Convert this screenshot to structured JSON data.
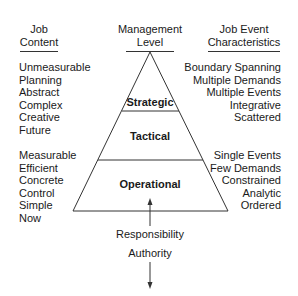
{
  "headers": {
    "left": [
      "Job",
      "Content"
    ],
    "center": [
      "Management",
      "Level"
    ],
    "right": [
      "Job Event",
      "Characteristics"
    ]
  },
  "levels": [
    "Strategic",
    "Tactical",
    "Operational"
  ],
  "left_upper": [
    "Unmeasurable",
    "Planning",
    "Abstract",
    "Complex",
    "Creative",
    "Future"
  ],
  "left_lower": [
    "Measurable",
    "Efficient",
    "Concrete",
    "Control",
    "Simple",
    "Now"
  ],
  "right_upper": [
    "Boundary Spanning",
    "Multiple Demands",
    "Multiple Events",
    "Integrative",
    "Scattered"
  ],
  "right_lower": [
    "Single Events",
    "Few Demands",
    "Constrained",
    "Analytic",
    "Ordered"
  ],
  "arrows": {
    "up_label": "Responsibility",
    "down_label": "Authority"
  },
  "colors": {
    "line": "#333333",
    "text": "#1a1a1a"
  }
}
